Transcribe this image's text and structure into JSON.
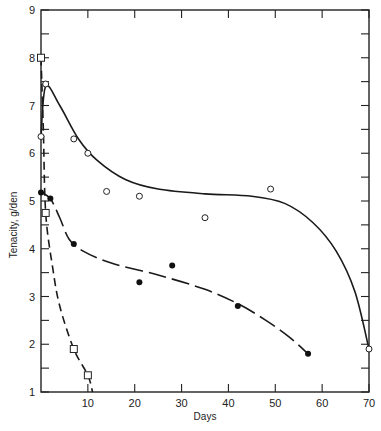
{
  "chart_data": {
    "type": "scatter",
    "title": "",
    "xlabel": "Days",
    "ylabel": "Tenacity,  g/den",
    "xlim": [
      0,
      70
    ],
    "ylim": [
      1,
      9
    ],
    "x_ticks": [
      10,
      20,
      30,
      40,
      50,
      60,
      70
    ],
    "y_ticks": [
      1,
      2,
      3,
      4,
      5,
      6,
      7,
      8,
      9
    ],
    "grid": false,
    "legend": null,
    "series": [
      {
        "name": "open-circles",
        "marker": "open-circle",
        "line": "solid",
        "points": [
          [
            0,
            6.35
          ],
          [
            1,
            7.45
          ],
          [
            7,
            6.3
          ],
          [
            10,
            6.0
          ],
          [
            14,
            5.2
          ],
          [
            21,
            5.1
          ],
          [
            35,
            4.65
          ],
          [
            49,
            5.25
          ],
          [
            70,
            1.9
          ]
        ],
        "curve": [
          [
            0,
            6.35
          ],
          [
            1,
            7.4
          ],
          [
            4,
            7.0
          ],
          [
            8,
            6.3
          ],
          [
            12,
            5.85
          ],
          [
            18,
            5.45
          ],
          [
            25,
            5.25
          ],
          [
            35,
            5.15
          ],
          [
            45,
            5.1
          ],
          [
            52,
            4.95
          ],
          [
            58,
            4.55
          ],
          [
            63,
            3.95
          ],
          [
            67,
            3.1
          ],
          [
            70,
            1.9
          ]
        ]
      },
      {
        "name": "filled-circles",
        "marker": "filled-circle",
        "line": "long-dash",
        "points": [
          [
            0,
            5.18
          ],
          [
            2,
            5.05
          ],
          [
            7,
            4.1
          ],
          [
            21,
            3.3
          ],
          [
            28,
            3.65
          ],
          [
            42,
            2.8
          ],
          [
            57,
            1.8
          ]
        ],
        "curve": [
          [
            0,
            5.18
          ],
          [
            2,
            5.05
          ],
          [
            4,
            4.65
          ],
          [
            6,
            4.2
          ],
          [
            9,
            3.95
          ],
          [
            15,
            3.7
          ],
          [
            25,
            3.45
          ],
          [
            35,
            3.15
          ],
          [
            42,
            2.85
          ],
          [
            48,
            2.5
          ],
          [
            53,
            2.15
          ],
          [
            57,
            1.8
          ]
        ]
      },
      {
        "name": "open-squares",
        "marker": "open-square",
        "line": "short-dash",
        "points": [
          [
            0,
            8.0
          ],
          [
            1,
            4.75
          ],
          [
            7,
            1.9
          ],
          [
            10,
            1.35
          ]
        ],
        "curve": [
          [
            0,
            8.0
          ],
          [
            0.5,
            6.5
          ],
          [
            1,
            4.75
          ],
          [
            2.5,
            3.6
          ],
          [
            4,
            2.8
          ],
          [
            7,
            1.9
          ],
          [
            10,
            1.35
          ],
          [
            11,
            1.0
          ]
        ]
      }
    ]
  }
}
